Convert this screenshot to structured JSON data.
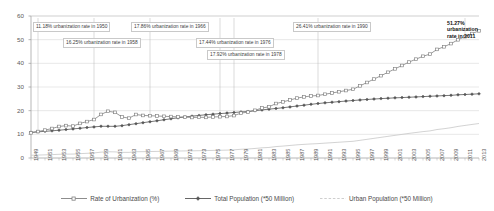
{
  "chart_data": {
    "type": "line",
    "title": "",
    "xlabel": "",
    "ylabel": "",
    "ylim": [
      0,
      60
    ],
    "yticks": [
      0,
      10,
      20,
      30,
      40,
      50,
      60
    ],
    "grid": true,
    "legend_position": "bottom",
    "x": [
      1949,
      1950,
      1951,
      1952,
      1953,
      1954,
      1955,
      1956,
      1957,
      1958,
      1959,
      1960,
      1961,
      1962,
      1963,
      1964,
      1965,
      1966,
      1967,
      1968,
      1969,
      1970,
      1971,
      1972,
      1973,
      1974,
      1975,
      1976,
      1977,
      1978,
      1979,
      1980,
      1981,
      1982,
      1983,
      1984,
      1985,
      1986,
      1987,
      1988,
      1989,
      1990,
      1991,
      1992,
      1993,
      1994,
      1995,
      1996,
      1997,
      1998,
      1999,
      2000,
      2001,
      2002,
      2003,
      2004,
      2005,
      2006,
      2007,
      2008,
      2009,
      2010,
      2011,
      2012,
      2013
    ],
    "xtick_labels": [
      "1949",
      "1951",
      "1953",
      "1955",
      "1957",
      "1959",
      "1961",
      "1963",
      "1965",
      "1967",
      "1969",
      "1971",
      "1973",
      "1975",
      "1977",
      "1979",
      "1981",
      "1983",
      "1985",
      "1987",
      "1989",
      "1991",
      "1993",
      "1995",
      "1997",
      "1999",
      "2001",
      "2003",
      "2005",
      "2007",
      "2009",
      "2011",
      "2013"
    ],
    "series": [
      {
        "name": "Rate of Urbanization (%)",
        "color": "#808080",
        "marker": "square-open",
        "values": [
          10.64,
          11.18,
          11.78,
          12.46,
          13.31,
          13.69,
          13.48,
          14.62,
          15.39,
          16.25,
          18.41,
          19.75,
          19.29,
          17.33,
          16.84,
          18.37,
          17.98,
          17.86,
          17.74,
          17.62,
          17.5,
          17.38,
          17.26,
          17.13,
          17.2,
          17.16,
          17.34,
          17.44,
          17.55,
          17.92,
          18.96,
          19.39,
          20.16,
          21.13,
          21.62,
          23.01,
          23.71,
          24.52,
          25.32,
          25.81,
          26.21,
          26.41,
          26.94,
          27.46,
          27.99,
          28.51,
          29.04,
          30.48,
          31.91,
          33.35,
          34.78,
          36.22,
          37.66,
          39.09,
          40.53,
          41.76,
          42.99,
          43.9,
          45.89,
          46.99,
          48.34,
          49.95,
          51.27,
          52.57,
          53.73
        ]
      },
      {
        "name": "Total Population (*50 Million)",
        "color": "#555555",
        "marker": "diamond-filled",
        "values": [
          10.83,
          11.06,
          11.27,
          11.48,
          11.75,
          12.01,
          12.3,
          12.57,
          12.87,
          13.15,
          13.4,
          13.39,
          13.38,
          13.67,
          14.09,
          14.5,
          14.93,
          15.33,
          15.72,
          16.16,
          16.58,
          16.98,
          17.34,
          17.68,
          17.99,
          18.27,
          18.52,
          18.76,
          18.97,
          19.23,
          19.46,
          19.67,
          19.99,
          20.33,
          20.64,
          20.93,
          21.24,
          21.6,
          21.96,
          22.32,
          22.68,
          23.01,
          23.3,
          23.57,
          23.82,
          24.06,
          24.29,
          24.52,
          24.73,
          24.92,
          25.09,
          25.26,
          25.41,
          25.54,
          25.67,
          25.81,
          25.94,
          26.09,
          26.22,
          26.35,
          26.47,
          26.7,
          26.83,
          26.98,
          27.12
        ]
      },
      {
        "name": "Urban Population (*50 Million)",
        "color": "#c8c8c8",
        "marker": "none",
        "values": [
          1.15,
          1.24,
          1.33,
          1.43,
          1.56,
          1.64,
          1.66,
          1.84,
          1.98,
          2.14,
          2.47,
          2.64,
          2.58,
          2.37,
          2.37,
          2.66,
          2.68,
          2.74,
          2.79,
          2.85,
          2.9,
          2.95,
          2.99,
          3.03,
          3.09,
          3.13,
          3.21,
          3.27,
          3.33,
          3.45,
          3.69,
          3.81,
          4.03,
          4.3,
          4.46,
          4.82,
          5.04,
          5.3,
          5.56,
          5.76,
          5.94,
          6.08,
          6.28,
          6.47,
          6.67,
          6.86,
          7.05,
          7.47,
          7.89,
          8.31,
          8.73,
          9.15,
          9.57,
          9.98,
          10.4,
          10.78,
          11.15,
          11.45,
          12.03,
          12.38,
          12.8,
          13.34,
          13.76,
          14.18,
          14.57
        ]
      }
    ],
    "annotations": [
      {
        "text": "11.18% urbanization rate in 1950",
        "year": 1950,
        "value": 11.18
      },
      {
        "text": "16.25% urbanization rate in 1958",
        "year": 1958,
        "value": 16.25
      },
      {
        "text": "17.86% urbanization rate in 1966",
        "year": 1966,
        "value": 17.86
      },
      {
        "text": "17.44% urbanization rate in 1976",
        "year": 1976,
        "value": 17.44
      },
      {
        "text": "17.92% urbanization rate in 1978",
        "year": 1978,
        "value": 17.92
      },
      {
        "text": "26.41% urbanization rate in 1990",
        "year": 1990,
        "value": 26.41
      },
      {
        "text": "51.27% urbanization rate in 2011",
        "year": 2011,
        "value": 51.27
      }
    ],
    "final_label": {
      "line1": "51.27%",
      "line2": "urbanization",
      "line3": "rate in 2011"
    }
  }
}
